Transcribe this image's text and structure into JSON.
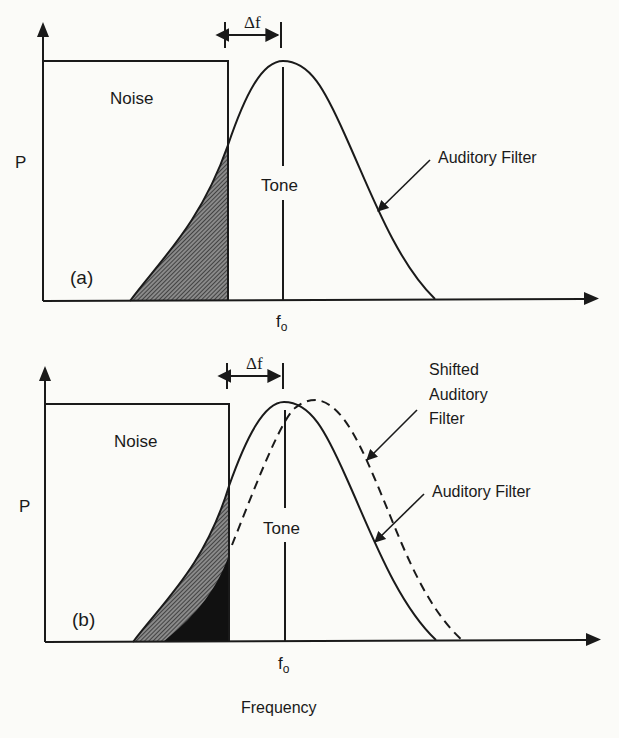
{
  "figure": {
    "panel_a": {
      "tag": "(a)",
      "y_label": "P",
      "noise_label": "Noise",
      "tone_label": "Tone",
      "delta_label": "Δf",
      "fo_label": "f",
      "fo_sub": "o",
      "filter_label": "Auditory Filter"
    },
    "panel_b": {
      "tag": "(b)",
      "y_label": "P",
      "noise_label": "Noise",
      "tone_label": "Tone",
      "delta_label": "Δf",
      "fo_label": "f",
      "fo_sub": "o",
      "shifted_label_1": "Shifted",
      "shifted_label_2": "Auditory",
      "shifted_label_3": "Filter",
      "filter_label": "Auditory Filter"
    },
    "x_axis_label": "Frequency",
    "colors": {
      "ink": "#1a1a1a",
      "hatch": "#555555",
      "paper": "#fbfbf8"
    }
  }
}
